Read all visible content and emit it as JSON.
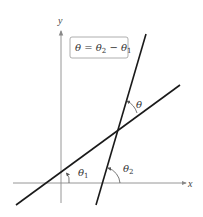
{
  "diagram": {
    "axes": {
      "x_label": "x",
      "y_label": "y"
    },
    "formula_box": {
      "text": "θ = θ2 − θ1",
      "lhs": "θ",
      "eq": " = ",
      "t2": "θ",
      "t2_sub": "2",
      "minus": " − ",
      "t1": "θ",
      "t1_sub": "1"
    },
    "angles": {
      "theta": {
        "label": "θ"
      },
      "theta1": {
        "label": "θ",
        "sub": "1"
      },
      "theta2": {
        "label": "θ",
        "sub": "2"
      }
    },
    "colors": {
      "line": "#1a1a1a",
      "axis": "#888888",
      "box_border": "#999999"
    }
  }
}
